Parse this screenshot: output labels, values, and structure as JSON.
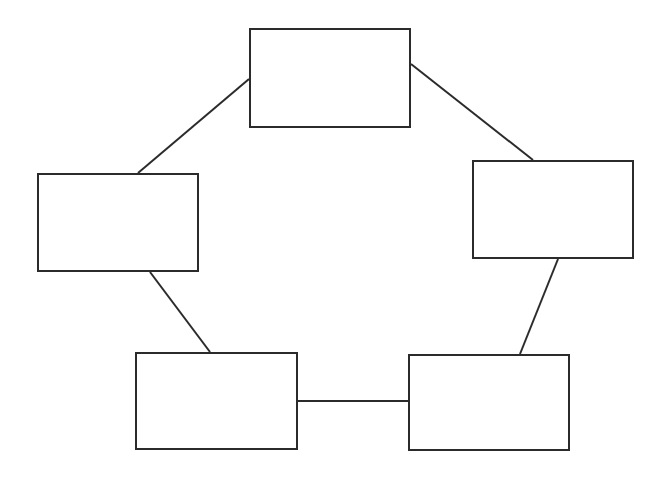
{
  "diagram": {
    "type": "ring",
    "stroke_color": "#2b2b2b",
    "background": "#ffffff",
    "nodes": [
      {
        "id": "top",
        "label": "",
        "x": 249,
        "y": 28,
        "w": 162,
        "h": 100
      },
      {
        "id": "left",
        "label": "",
        "x": 37,
        "y": 173,
        "w": 162,
        "h": 99
      },
      {
        "id": "right",
        "label": "",
        "x": 472,
        "y": 160,
        "w": 162,
        "h": 99
      },
      {
        "id": "bottom-left",
        "label": "",
        "x": 135,
        "y": 352,
        "w": 163,
        "h": 98
      },
      {
        "id": "bottom-right",
        "label": "",
        "x": 408,
        "y": 354,
        "w": 162,
        "h": 97
      }
    ],
    "edges": [
      {
        "from": "top",
        "to": "left",
        "x1": 249,
        "y1": 79,
        "x2": 138,
        "y2": 173
      },
      {
        "from": "top",
        "to": "right",
        "x1": 411,
        "y1": 64,
        "x2": 533,
        "y2": 160
      },
      {
        "from": "right",
        "to": "bottom-right",
        "x1": 558,
        "y1": 259,
        "x2": 520,
        "y2": 354
      },
      {
        "from": "left",
        "to": "bottom-left",
        "x1": 150,
        "y1": 272,
        "x2": 210,
        "y2": 352
      },
      {
        "from": "bottom-left",
        "to": "bottom-right",
        "x1": 298,
        "y1": 401,
        "x2": 408,
        "y2": 401
      }
    ]
  }
}
